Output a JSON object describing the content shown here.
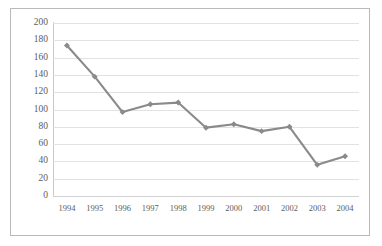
{
  "chart_data": {
    "type": "line",
    "title": "",
    "xlabel": "",
    "ylabel": "",
    "categories": [
      "1994",
      "1995",
      "1996",
      "1997",
      "1998",
      "1999",
      "2000",
      "2001",
      "2002",
      "2003",
      "2004"
    ],
    "values": [
      174,
      138,
      97,
      106,
      108,
      79,
      83,
      75,
      80,
      36,
      46
    ],
    "series": [
      {
        "name": "",
        "values": [
          174,
          138,
          97,
          106,
          108,
          79,
          83,
          75,
          80,
          36,
          46
        ]
      }
    ],
    "ylim": [
      0,
      200
    ],
    "ytick_labels": [
      "200",
      "180",
      "160",
      "140",
      "120",
      "100",
      "80",
      "60",
      "40",
      "20",
      "0"
    ],
    "ytick_values": [
      200,
      180,
      160,
      140,
      120,
      100,
      80,
      60,
      40,
      20,
      0
    ],
    "xtick_labels": [
      "1994",
      "1995",
      "1996",
      "1997",
      "1998",
      "1999",
      "2000",
      "2001",
      "2002",
      "2003",
      "2004"
    ],
    "grid": "horizontal",
    "legend": "none",
    "line_color": "#8a8a8a",
    "marker_color": "#8a8a8a",
    "grid_color": "#e2e2e2",
    "border_color": "#b9b9b9",
    "axis_text_color": "#5c5c5c",
    "plot_background": "#ffffff"
  }
}
